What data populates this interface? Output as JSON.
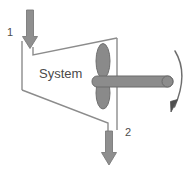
{
  "diagram": {
    "system_label": "System",
    "inlet_label": "1",
    "outlet_label": "2",
    "icons": {
      "inlet_arrow": "arrow-down-icon",
      "outlet_arrow": "arrow-down-icon",
      "rotation_arrow": "curved-rotation-arrow-icon",
      "propeller": "propeller-icon",
      "shaft": "shaft-icon",
      "boundary": "system-boundary-icon"
    },
    "colors": {
      "arrow_fill": "#8f8f8f",
      "arrow_stroke": "#6e6e6e",
      "shaft_fill": "#8c8c8c",
      "shaft_stroke": "#6b6b6b",
      "blade_fill": "#8a8a8a",
      "blade_stroke": "#6b6b6b",
      "boundary_stroke": "#8c8c8c",
      "text": "#4a4a4a",
      "background": "#ffffff"
    }
  }
}
